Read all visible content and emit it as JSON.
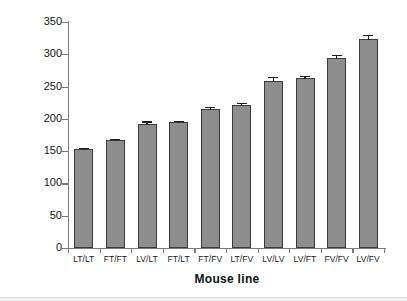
{
  "chart_data": {
    "type": "bar",
    "title": "",
    "xlabel": "Mouse line",
    "ylabel": "Incubation time (days)",
    "categories": [
      "LT/LT",
      "FT/FT",
      "LV/LT",
      "FT/LT",
      "FT/FV",
      "LT/FV",
      "LV/LV",
      "LV/FT",
      "FV/FV",
      "LV/FV"
    ],
    "values": [
      153,
      167,
      192,
      195,
      215,
      222,
      259,
      263,
      294,
      324
    ],
    "errors": [
      2,
      2,
      4,
      2,
      3,
      3,
      6,
      3,
      5,
      6
    ],
    "ylim": [
      0,
      350
    ],
    "yticks": [
      0,
      50,
      100,
      150,
      200,
      250,
      300,
      350
    ],
    "ytick_labels": [
      "0",
      "50",
      "100",
      "150",
      "200",
      "250",
      "300",
      "350"
    ],
    "grid": false,
    "legend": false,
    "bar_color": "#8d8d8d",
    "bar_edge_color": "#3b3b3b",
    "error_bar_color": "#1c1c1c",
    "axis_color": "#7c7c7c",
    "background": "#ffffff"
  }
}
